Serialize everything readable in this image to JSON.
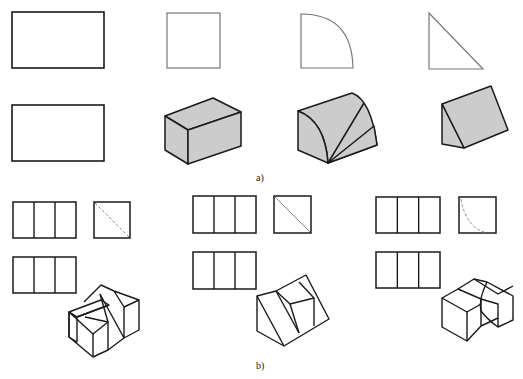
{
  "labels": {
    "part_a": "a)",
    "part_b": "b)"
  },
  "colors": {
    "stroke": "#1a1a1a",
    "gray_stroke": "#777777",
    "fill": "#cccccc",
    "dash": "#888888",
    "background": "#ffffff"
  },
  "part_a": {
    "views": [
      {
        "name": "front-view-rect",
        "type": "rect",
        "x": 12,
        "y": 12,
        "w": 92,
        "h": 56,
        "style": "dark"
      },
      {
        "name": "top-view-rect",
        "type": "rect",
        "x": 12,
        "y": 105,
        "w": 92,
        "h": 56,
        "style": "dark"
      },
      {
        "name": "side-view-square",
        "type": "rect",
        "x": 167,
        "y": 13,
        "w": 53,
        "h": 55,
        "style": "gray"
      },
      {
        "name": "side-view-quarter-circle",
        "type": "path",
        "d": "M301,68 L301,14 Q352,14 353,68 Z",
        "style": "gray"
      },
      {
        "name": "side-view-triangle",
        "type": "path",
        "d": "M429,13 L429,69 L483,69 Z",
        "style": "gray"
      }
    ],
    "solids": [
      {
        "name": "box-isometric",
        "faces": [
          "M165,116 L213,98 L241,112 L188,130 Z",
          "M165,116 L188,130 L188,164 L165,150 Z",
          "M188,130 L241,112 L241,146 L188,164 Z"
        ]
      },
      {
        "name": "quarter-cylinder-isometric",
        "faces": [
          "M298,111 L352,93 Q371,100 377,145 L328,163 Q325,121 298,111 Z",
          "M298,111 Q325,121 328,163 L298,150 Z",
          "M328,163 L377,145 L374,126 Z"
        ],
        "lines": [
          "M328,163 L364,103"
        ]
      },
      {
        "name": "wedge-isometric",
        "faces": [
          "M442,104 L491,86 L508,130 L464,148 Z",
          "M442,104 L464,148 L442,144 Z"
        ]
      }
    ]
  },
  "part_b": {
    "groups": [
      {
        "name": "variant-1",
        "front": {
          "x": 13,
          "y": 202,
          "w": 63,
          "h": 36
        },
        "top": {
          "x": 13,
          "y": 257,
          "w": 63,
          "h": 36
        },
        "side": {
          "x": 94,
          "y": 202,
          "w": 36,
          "h": 36
        },
        "side_hidden": "M95,203 L129,237",
        "side_hidden_type": "diagonal",
        "iso_lines": [
          "M69,312 L101,300 L109,305 L77,317 Z",
          "M69,312 L77,317 L77,342 L69,337 Z",
          "M77,317 L109,305",
          "M69,312 L69,337 L93,357 L108,350 L108,322 L85,317",
          "M93,357 L93,334",
          "M69,312 L93,334 L108,322",
          "M84,302 L101,285 L114,291 L139,300 L139,330 L124,338 L124,307 L114,291",
          "M100,294 L124,338",
          "M124,307 L139,300",
          "M108,322 L100,294",
          "M108,350 L124,338"
        ]
      },
      {
        "name": "variant-2",
        "front": {
          "x": 193,
          "y": 196,
          "w": 63,
          "h": 37
        },
        "top": {
          "x": 193,
          "y": 252,
          "w": 63,
          "h": 37
        },
        "side": {
          "x": 274,
          "y": 196,
          "w": 37,
          "h": 37
        },
        "side_hidden": "M275,197 L310,232",
        "side_hidden_type": "diagonal-solid-gray",
        "iso_lines": [
          "M257,296 L276,291 L306,275 L329,319 L284,346 L257,331 Z",
          "M257,296 L284,346",
          "M276,291 L299,333",
          "M276,291 L290,304 L314,298 L299,282",
          "M290,304 L299,333",
          "M314,298 L314,326"
        ]
      },
      {
        "name": "variant-3",
        "front": {
          "x": 376,
          "y": 197,
          "w": 64,
          "h": 36
        },
        "top": {
          "x": 376,
          "y": 252,
          "w": 64,
          "h": 36
        },
        "side": {
          "x": 459,
          "y": 197,
          "w": 37,
          "h": 36
        },
        "side_hidden": "M461,199 Q466,228 487,233",
        "side_hidden_type": "arc-dashed",
        "iso_lines": [
          "M442,298 L458,289 L481,299 L481,326 L467,341 L442,327 Z",
          "M442,298 L467,312 L481,304",
          "M467,312 L467,341",
          "M458,289 L474,279 L487,282 L513,296 L513,320 L498,327 L498,304 L481,299",
          "M474,279 L498,294 L513,286",
          "M487,282 Q478,300 481,311 Q488,320 498,327",
          "M481,326 L498,318"
        ]
      }
    ]
  }
}
